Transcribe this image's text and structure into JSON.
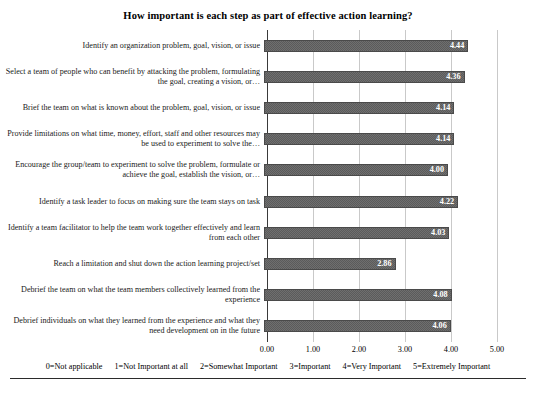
{
  "chart_data": {
    "type": "bar",
    "orientation": "horizontal",
    "title": "How important is each step as part of effective action learning?",
    "xlabel": "",
    "ylabel": "",
    "xlim": [
      0.0,
      5.0
    ],
    "xticks": [
      "0.00",
      "1.00",
      "2.00",
      "3.00",
      "4.00",
      "5.00"
    ],
    "xtick_values": [
      0,
      1,
      2,
      3,
      4,
      5
    ],
    "grid": true,
    "legend_position": "below-axis",
    "categories": [
      "Identify an organization problem, goal, vision, or issue",
      "Select a team of people who can benefit by attacking the problem, formulating the goal, creating a vision, or…",
      "Brief the team on what is known about the problem, goal, vision, or issue",
      "Provide limitations on what time, money, effort, staff and other resources may be used to experiment to solve the…",
      "Encourage the group/team to experiment to solve the problem, formulate or achieve the goal, establish the vision, or…",
      "Identify a task leader to focus on making sure the team stays on task",
      "Identify a team facilitator to help the team work together effectively and learn from each other",
      "Reach a limitation and shut down the action learning project/set",
      "Debrief the team on what the team members collectively learned from the experience",
      "Debrief individuals on what they learned from the experience and what they need development on in the future"
    ],
    "values": [
      4.44,
      4.36,
      4.14,
      4.14,
      4.0,
      4.22,
      4.03,
      2.86,
      4.08,
      4.06
    ],
    "value_labels": [
      "4.44",
      "4.36",
      "4.14",
      "4.14",
      "4.00",
      "4.22",
      "4.03",
      "2.86",
      "4.08",
      "4.06"
    ],
    "scale_key": [
      "0=Not applicable",
      "1=Not Important at all",
      "2=Somewhat Important",
      "3=Important",
      "4=Very Important",
      "5=Extremely Important"
    ],
    "colors": {
      "bar_fill": "#5b5b5b",
      "bar_pattern": "#6f6f6f",
      "bar_border": "#4a4a4a",
      "value_label": "#ffffff",
      "gridline": "#c9c9c9",
      "axis": "#3a3a3a",
      "text": "#1a1a1a",
      "background": "#ffffff"
    }
  }
}
